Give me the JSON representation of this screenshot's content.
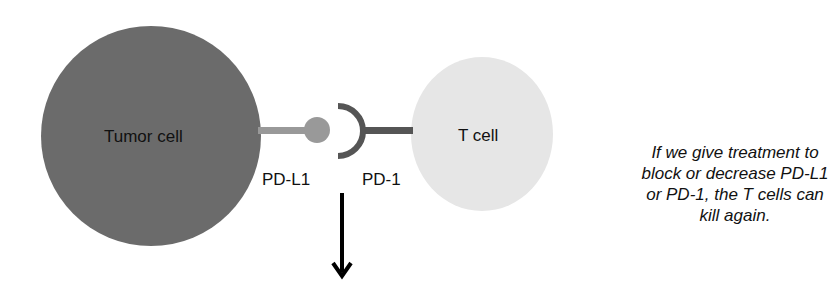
{
  "diagram": {
    "tumor_cell": {
      "label": "Tumor cell",
      "color": "#6b6b6b"
    },
    "t_cell": {
      "label": "T cell",
      "color": "#e6e6e6"
    },
    "ligand": {
      "label": "PD-L1",
      "color": "#999999"
    },
    "receptor": {
      "label": "PD-1",
      "color": "#555555"
    },
    "arrow": {
      "direction": "down",
      "color": "#000000"
    },
    "note": "If we give treatment to block or decrease PD-L1 or PD-1, the T cells can kill again."
  }
}
